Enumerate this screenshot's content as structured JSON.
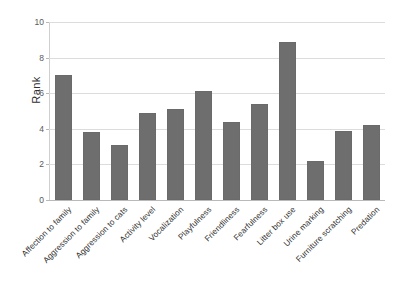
{
  "chart_data": {
    "type": "bar",
    "title": "",
    "subtitle": "",
    "xlabel": "",
    "ylabel": "Rank",
    "ylim": [
      0,
      10
    ],
    "yticks": [
      0,
      2,
      4,
      6,
      8,
      10
    ],
    "grid": true,
    "legend": false,
    "bar_color": "#6e6e6e",
    "gridline_color": "#dcdcdc",
    "axis_color": "#b9b9b9",
    "categories": [
      "Affection to family",
      "Aggression to family",
      "Aggression to cats",
      "Activity level",
      "Vocalization",
      "Playfulness",
      "Friendliness",
      "Fearfulness",
      "Litter box use",
      "Urine marking",
      "Furniture scratching",
      "Predation"
    ],
    "values": [
      7.0,
      3.8,
      3.1,
      4.9,
      5.1,
      6.1,
      4.4,
      5.4,
      8.9,
      2.2,
      3.9,
      4.2
    ]
  }
}
